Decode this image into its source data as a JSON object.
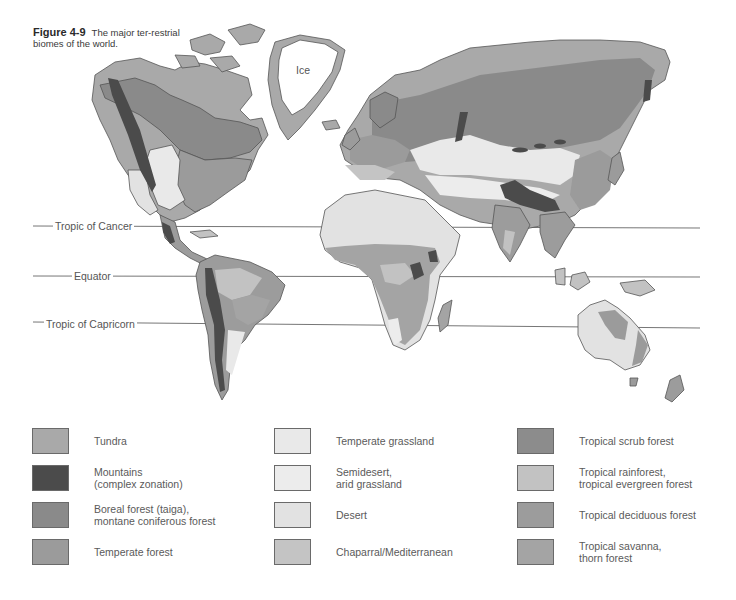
{
  "caption": {
    "figure_number": "Figure 4-9",
    "text": "The major ter-restrial biomes of the world."
  },
  "map": {
    "region_label_ice": "Ice",
    "lines": [
      {
        "name": "tropic-of-cancer",
        "label": "Tropic of Cancer"
      },
      {
        "name": "equator",
        "label": "Equator"
      },
      {
        "name": "tropic-of-capricorn",
        "label": "Tropic of Capricorn"
      }
    ]
  },
  "colors": {
    "tundra": "#a9a9a9",
    "mountains": "#4b4b4b",
    "boreal": "#8a8a8a",
    "temperate_forest": "#9b9b9b",
    "temperate_grassland": "#e9e9e9",
    "semidesert": "#ececec",
    "desert": "#e2e2e2",
    "chaparral": "#c4c4c4",
    "tropical_scrub": "#8c8c8c",
    "tropical_rainforest": "#c2c2c2",
    "tropical_deciduous": "#9c9c9c",
    "tropical_savanna": "#a4a4a4",
    "ice": "#ffffff",
    "outline": "#555555"
  },
  "legend": {
    "columns": [
      [
        {
          "key": "tundra",
          "label": "Tundra"
        },
        {
          "key": "mountains",
          "label": "Mountains\n(complex zonation)"
        },
        {
          "key": "boreal",
          "label": "Boreal forest (taiga),\nmontane coniferous forest"
        },
        {
          "key": "temperate_forest",
          "label": "Temperate forest"
        }
      ],
      [
        {
          "key": "temperate_grassland",
          "label": "Temperate grassland"
        },
        {
          "key": "semidesert",
          "label": "Semidesert,\narid grassland"
        },
        {
          "key": "desert",
          "label": "Desert"
        },
        {
          "key": "chaparral",
          "label": "Chaparral/Mediterranean"
        }
      ],
      [
        {
          "key": "tropical_scrub",
          "label": "Tropical scrub forest"
        },
        {
          "key": "tropical_rainforest",
          "label": "Tropical rainforest,\ntropical evergreen forest"
        },
        {
          "key": "tropical_deciduous",
          "label": "Tropical deciduous forest"
        },
        {
          "key": "tropical_savanna",
          "label": "Tropical savanna,\nthorn forest"
        }
      ]
    ]
  }
}
